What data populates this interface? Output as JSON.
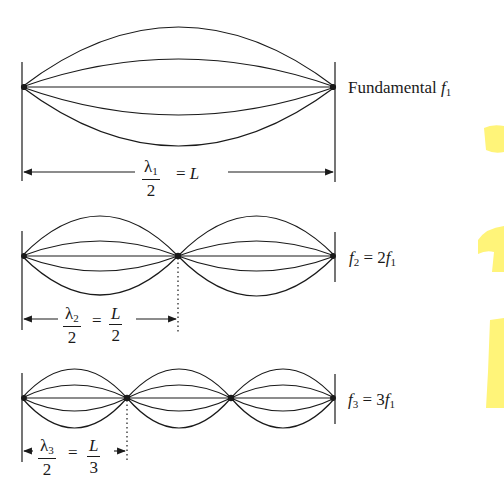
{
  "figure": {
    "stroke_color": "#1a1a1a",
    "watermark_color": "#fff36b"
  },
  "harmonics": [
    {
      "id": "first",
      "label_text": "Fundamental",
      "label_symbol": "f",
      "label_subscript": "1",
      "loops": 1,
      "dimension": {
        "lambda_symbol": "λ",
        "lambda_subscript": "1",
        "denominator": "2",
        "equals": "=",
        "rhs": "L"
      }
    },
    {
      "id": "second",
      "label_symbol": "f",
      "label_subscript": "2",
      "label_equals": "=",
      "label_rhs_coef": "2",
      "label_rhs_symbol": "f",
      "label_rhs_subscript": "1",
      "loops": 2,
      "dimension": {
        "lambda_symbol": "λ",
        "lambda_subscript": "2",
        "denominator": "2",
        "equals": "=",
        "rhs_num": "L",
        "rhs_den": "2"
      }
    },
    {
      "id": "third",
      "label_symbol": "f",
      "label_subscript": "3",
      "label_equals": "=",
      "label_rhs_coef": "3",
      "label_rhs_symbol": "f",
      "label_rhs_subscript": "1",
      "loops": 3,
      "dimension": {
        "lambda_symbol": "λ",
        "lambda_subscript": "3",
        "denominator": "2",
        "equals": "=",
        "rhs_num": "L",
        "rhs_den": "3"
      }
    }
  ]
}
